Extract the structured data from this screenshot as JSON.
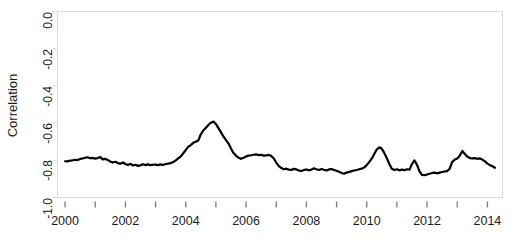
{
  "chart_data": {
    "type": "line",
    "title": "",
    "xlabel": "",
    "ylabel": "Correlation",
    "xlim": [
      1999.75,
      2014.5
    ],
    "ylim": [
      -1.0,
      0.0
    ],
    "grid": false,
    "legend": false,
    "legend_position": "none",
    "line_color": "#000000",
    "line_width": 2.2,
    "axis_color": "#d9d9d9",
    "text_color": "#1a1a1a",
    "background": "#ffffff",
    "ytick_labels": [
      "0.0",
      "-0.2",
      "-0.4",
      "-0.6",
      "-0.8",
      "-1.0"
    ],
    "ytick_values": [
      0.0,
      -0.2,
      -0.4,
      -0.6,
      -0.8,
      -1.0
    ],
    "xtick_values": [
      2000,
      2001,
      2002,
      2003,
      2004,
      2005,
      2006,
      2007,
      2008,
      2009,
      2010,
      2011,
      2012,
      2013,
      2014
    ],
    "xtick_labels": [
      "2000",
      "",
      "2002",
      "",
      "2004",
      "",
      "2006",
      "",
      "2008",
      "",
      "2010",
      "",
      "2012",
      "",
      "2014"
    ],
    "series": [
      {
        "name": "Correlation",
        "x": [
          2000.0,
          2000.08,
          2000.17,
          2000.25,
          2000.33,
          2000.42,
          2000.5,
          2000.58,
          2000.67,
          2000.75,
          2000.83,
          2000.92,
          2001.0,
          2001.08,
          2001.17,
          2001.25,
          2001.33,
          2001.42,
          2001.5,
          2001.58,
          2001.67,
          2001.75,
          2001.83,
          2001.92,
          2002.0,
          2002.08,
          2002.17,
          2002.25,
          2002.33,
          2002.42,
          2002.5,
          2002.58,
          2002.67,
          2002.75,
          2002.83,
          2002.92,
          2003.0,
          2003.08,
          2003.17,
          2003.25,
          2003.33,
          2003.42,
          2003.5,
          2003.58,
          2003.67,
          2003.75,
          2003.83,
          2003.92,
          2004.0,
          2004.08,
          2004.17,
          2004.25,
          2004.33,
          2004.42,
          2004.5,
          2004.58,
          2004.67,
          2004.75,
          2004.83,
          2004.92,
          2005.0,
          2005.08,
          2005.17,
          2005.25,
          2005.33,
          2005.42,
          2005.5,
          2005.58,
          2005.67,
          2005.75,
          2005.83,
          2005.92,
          2006.0,
          2006.08,
          2006.17,
          2006.25,
          2006.33,
          2006.42,
          2006.5,
          2006.58,
          2006.67,
          2006.75,
          2006.83,
          2006.92,
          2007.0,
          2007.08,
          2007.17,
          2007.25,
          2007.33,
          2007.42,
          2007.5,
          2007.58,
          2007.67,
          2007.75,
          2007.83,
          2007.92,
          2008.0,
          2008.08,
          2008.17,
          2008.25,
          2008.33,
          2008.42,
          2008.5,
          2008.58,
          2008.67,
          2008.75,
          2008.83,
          2008.92,
          2009.0,
          2009.08,
          2009.17,
          2009.25,
          2009.33,
          2009.42,
          2009.5,
          2009.58,
          2009.67,
          2009.75,
          2009.83,
          2009.92,
          2010.0,
          2010.08,
          2010.17,
          2010.25,
          2010.33,
          2010.42,
          2010.5,
          2010.58,
          2010.67,
          2010.75,
          2010.83,
          2010.92,
          2011.0,
          2011.08,
          2011.17,
          2011.25,
          2011.33,
          2011.42,
          2011.5,
          2011.58,
          2011.67,
          2011.75,
          2011.83,
          2011.92,
          2012.0,
          2012.08,
          2012.17,
          2012.25,
          2012.33,
          2012.42,
          2012.5,
          2012.58,
          2012.67,
          2012.75,
          2012.83,
          2012.92,
          2013.0,
          2013.08,
          2013.17,
          2013.25,
          2013.33,
          2013.42,
          2013.5,
          2013.58,
          2013.67,
          2013.75,
          2013.83,
          2013.92,
          2014.0,
          2014.08,
          2014.17,
          2014.25
        ],
        "values": [
          -0.805,
          -0.806,
          -0.802,
          -0.8,
          -0.797,
          -0.799,
          -0.793,
          -0.79,
          -0.786,
          -0.784,
          -0.789,
          -0.787,
          -0.791,
          -0.788,
          -0.783,
          -0.795,
          -0.792,
          -0.799,
          -0.806,
          -0.812,
          -0.808,
          -0.815,
          -0.818,
          -0.812,
          -0.82,
          -0.825,
          -0.819,
          -0.828,
          -0.824,
          -0.83,
          -0.827,
          -0.821,
          -0.826,
          -0.822,
          -0.826,
          -0.824,
          -0.823,
          -0.826,
          -0.822,
          -0.825,
          -0.82,
          -0.818,
          -0.815,
          -0.81,
          -0.8,
          -0.79,
          -0.78,
          -0.762,
          -0.745,
          -0.728,
          -0.718,
          -0.706,
          -0.7,
          -0.693,
          -0.66,
          -0.64,
          -0.625,
          -0.61,
          -0.598,
          -0.592,
          -0.605,
          -0.626,
          -0.65,
          -0.672,
          -0.69,
          -0.71,
          -0.736,
          -0.76,
          -0.776,
          -0.786,
          -0.792,
          -0.786,
          -0.78,
          -0.775,
          -0.773,
          -0.77,
          -0.768,
          -0.772,
          -0.77,
          -0.775,
          -0.774,
          -0.771,
          -0.776,
          -0.79,
          -0.812,
          -0.83,
          -0.842,
          -0.848,
          -0.845,
          -0.85,
          -0.852,
          -0.846,
          -0.849,
          -0.855,
          -0.858,
          -0.852,
          -0.849,
          -0.854,
          -0.85,
          -0.843,
          -0.848,
          -0.852,
          -0.847,
          -0.851,
          -0.855,
          -0.849,
          -0.847,
          -0.852,
          -0.856,
          -0.862,
          -0.868,
          -0.872,
          -0.866,
          -0.862,
          -0.858,
          -0.855,
          -0.852,
          -0.848,
          -0.845,
          -0.838,
          -0.826,
          -0.81,
          -0.79,
          -0.766,
          -0.742,
          -0.73,
          -0.738,
          -0.76,
          -0.79,
          -0.82,
          -0.845,
          -0.852,
          -0.848,
          -0.854,
          -0.85,
          -0.853,
          -0.848,
          -0.85,
          -0.82,
          -0.8,
          -0.826,
          -0.86,
          -0.878,
          -0.88,
          -0.876,
          -0.872,
          -0.868,
          -0.866,
          -0.87,
          -0.866,
          -0.863,
          -0.86,
          -0.858,
          -0.845,
          -0.81,
          -0.796,
          -0.79,
          -0.776,
          -0.75,
          -0.766,
          -0.78,
          -0.788,
          -0.79,
          -0.788,
          -0.792,
          -0.79,
          -0.796,
          -0.806,
          -0.818,
          -0.826,
          -0.832,
          -0.84
        ]
      }
    ]
  },
  "axis": {
    "ylabel_text": "Correlation"
  }
}
